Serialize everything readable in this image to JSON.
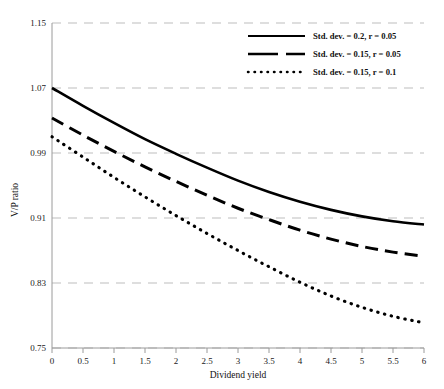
{
  "chart_data": {
    "type": "line",
    "title": "",
    "xlabel": "Dividend yield",
    "ylabel": "V/P ratio",
    "xlim": [
      0,
      6
    ],
    "ylim": [
      0.75,
      1.15
    ],
    "xticks": [
      "0",
      "0.5",
      "1",
      "1.5",
      "2",
      "2.5",
      "3",
      "3.5",
      "4",
      "4.5",
      "5",
      "5.5",
      "6"
    ],
    "xtick_values": [
      0,
      0.5,
      1,
      1.5,
      2,
      2.5,
      3,
      3.5,
      4,
      4.5,
      5,
      5.5,
      6
    ],
    "yticks": [
      "1.15",
      "1.07",
      "0.99",
      "0.91",
      "0.83",
      "0.75"
    ],
    "ytick_values": [
      1.15,
      1.07,
      0.99,
      0.91,
      0.83,
      0.75
    ],
    "grid": true,
    "grid_style": "dashed",
    "grid_color": "#bdbdbd",
    "legend_position": "top-right",
    "x": [
      0,
      0.5,
      1,
      1.5,
      2,
      2.5,
      3,
      3.5,
      4,
      4.5,
      5,
      5.5,
      6
    ],
    "series": [
      {
        "name": "Std. dev. = 0.2, r = 0.05",
        "style": "solid",
        "color": "#000000",
        "values": [
          1.07,
          1.048,
          1.027,
          1.007,
          0.989,
          0.972,
          0.956,
          0.942,
          0.93,
          0.92,
          0.912,
          0.906,
          0.902
        ]
      },
      {
        "name": "Std. dev. = 0.15, r = 0.05",
        "style": "dashed",
        "color": "#000000",
        "values": [
          1.033,
          1.012,
          0.992,
          0.973,
          0.955,
          0.938,
          0.922,
          0.908,
          0.895,
          0.884,
          0.875,
          0.868,
          0.863
        ]
      },
      {
        "name": "Std. dev. = 0.15, r = 0.1",
        "style": "dotted",
        "color": "#000000",
        "values": [
          1.01,
          0.985,
          0.96,
          0.936,
          0.913,
          0.891,
          0.87,
          0.85,
          0.831,
          0.814,
          0.8,
          0.789,
          0.781
        ]
      }
    ]
  },
  "axis": {
    "y_title": "V/P ratio",
    "x_title": "Dividend yield"
  },
  "legend": {
    "entries": [
      {
        "label": "Std. dev. = 0.2, r = 0.05",
        "style": "solid"
      },
      {
        "label": "Std. dev. = 0.15, r = 0.05",
        "style": "dashed"
      },
      {
        "label": "Std. dev. = 0.15, r = 0.1",
        "style": "dotted"
      }
    ]
  }
}
